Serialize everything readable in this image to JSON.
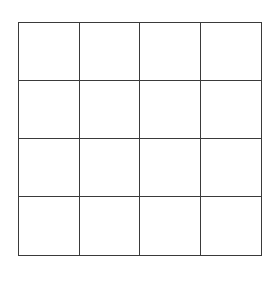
{
  "diagram": {
    "type": "grid",
    "rows": 4,
    "columns": 4,
    "cells": [
      [
        "",
        "",
        "",
        ""
      ],
      [
        "",
        "",
        "",
        ""
      ],
      [
        "",
        "",
        "",
        ""
      ],
      [
        "",
        "",
        "",
        ""
      ]
    ],
    "colors": {
      "background": "#ffffff",
      "line": "#3a3a3a"
    }
  }
}
